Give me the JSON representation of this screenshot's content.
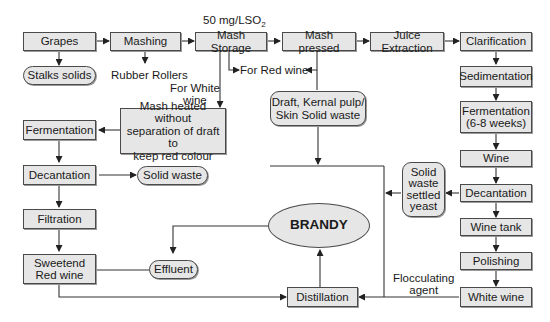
{
  "diagram": {
    "type": "flowchart",
    "nodes": {
      "grapes": "Grapes",
      "mashing": "Mashing",
      "mash_storage": "Mash Storage",
      "mash_pressed": "Mash pressed",
      "juice_extraction": "Juice Extraction",
      "clarification": "Clarification",
      "stalks_solids": "Stalks solids",
      "sedimentation": "Sedimentation",
      "fermentation_white_line1": "Fermentation",
      "fermentation_white_line2": "(6-8 weeks)",
      "wine": "Wine",
      "decantation_white": "Decantation",
      "wine_tank": "Wine tank",
      "polishing": "Polishing",
      "white_wine": "White wine",
      "mash_heated_line1": "Mash heated without",
      "mash_heated_line2": "separation of draft to",
      "mash_heated_line3": "keep red colour",
      "draft_line1": "Draft, Kernal pulp/",
      "draft_line2": "Skin Solid waste",
      "fermentation_red": "Fermentation",
      "decantation_red": "Decantation",
      "solid_waste": "Solid waste",
      "filtration": "Filtration",
      "sweetend_line1": "Sweetend",
      "sweetend_line2": "Red wine",
      "effluent": "Effluent",
      "brandy": "BRANDY",
      "solid_waste_yeast_line1": "Solid",
      "solid_waste_yeast_line2": "waste",
      "solid_waste_yeast_line3": "settled",
      "solid_waste_yeast_line4": "yeast",
      "distillation": "Distillation"
    },
    "labels": {
      "so2": "50 mg/LSO",
      "so2_sub": "2",
      "rubber_rollers": "Rubber Rollers",
      "for_white_line1": "For White",
      "for_white_line2": "wine",
      "for_red_wine": "For Red wine",
      "flocculating_line1": "Flocculating",
      "flocculating_line2": "agent"
    },
    "colors": {
      "box_fill": "#e6e6e6",
      "stroke": "#333333",
      "background": "#ffffff"
    }
  }
}
